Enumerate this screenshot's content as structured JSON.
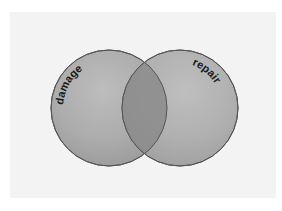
{
  "diagram": {
    "type": "venn",
    "sets": [
      {
        "id": "damage",
        "label": "damage",
        "cx": 109,
        "cy": 108,
        "r": 58,
        "fill": "#a9a9a9"
      },
      {
        "id": "repair",
        "label": "repair",
        "cx": 180,
        "cy": 108,
        "r": 58,
        "fill": "#a9a9a9"
      }
    ],
    "overlap": {
      "fill": "#8a8a8a"
    },
    "colors": {
      "background": "#f3f3f3",
      "page": "#ffffff",
      "stroke": "#555555",
      "text": "#1a1a1a"
    }
  }
}
